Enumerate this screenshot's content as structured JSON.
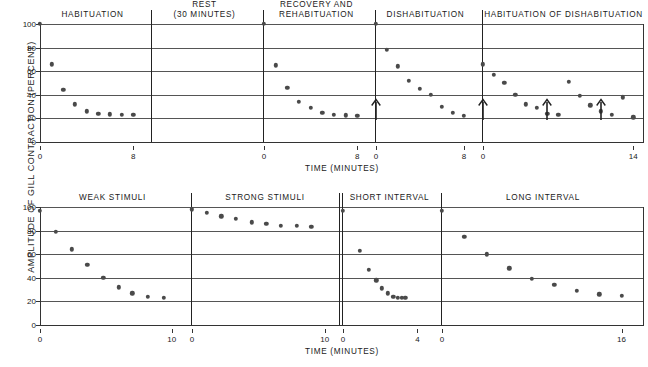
{
  "figure": {
    "y_axis_label": "AMPLITUDE OF GILL CONTRACTION (PERCENT)",
    "x_axis_label": "TIME (MINUTES)",
    "y_ticks": [
      0,
      20,
      40,
      60,
      80,
      100
    ],
    "dot_color": "#4a4a4a",
    "axis_color": "#333333",
    "grid_color": "#555555"
  },
  "chart_data": [
    {
      "type": "scatter",
      "id": "top-chart",
      "title": "",
      "xlabel": "TIME (MINUTES)",
      "ylabel": "AMPLITUDE OF GILL CONTRACTION (PERCENT)",
      "ylim": [
        0,
        100
      ],
      "yticks": [
        0,
        20,
        40,
        60,
        80,
        100
      ],
      "grid": true,
      "panels": [
        {
          "label": "HABITUATION",
          "xlim": [
            0,
            9
          ],
          "xticks": [
            0,
            8
          ],
          "x": [
            0,
            1,
            2,
            3,
            4,
            5,
            6,
            7,
            8
          ],
          "values": [
            100,
            66,
            44,
            32,
            26,
            24,
            23.5,
            23,
            23
          ],
          "arrows": []
        },
        {
          "label": "REST\n(30 MINUTES)",
          "label_line1": "REST",
          "label_line2": "(30 MINUTES)",
          "xlim": [
            0,
            9
          ],
          "xticks": [],
          "x": [],
          "values": [],
          "arrows": []
        },
        {
          "label": "RECOVERY AND\nREHABITUATION",
          "label_line1": "RECOVERY AND",
          "label_line2": "REHABITUATION",
          "xlim": [
            0,
            9
          ],
          "xticks": [
            0,
            8
          ],
          "x": [
            0,
            1,
            2,
            3,
            4,
            5,
            6,
            7,
            8
          ],
          "values": [
            100,
            65,
            46,
            34,
            29,
            25,
            23,
            22.5,
            22
          ],
          "arrows": []
        },
        {
          "label": "DISHABITUATION",
          "xlim": [
            0,
            9
          ],
          "xticks": [
            0,
            8
          ],
          "x": [
            0,
            1,
            2,
            3,
            4,
            5,
            6,
            7,
            8
          ],
          "values": [
            100,
            78,
            64,
            52,
            45,
            40,
            30,
            25,
            22
          ],
          "arrows": [
            0
          ]
        },
        {
          "label": "HABITUATION OF DISHABITUATION",
          "xlim": [
            0,
            15
          ],
          "xticks": [
            0,
            14
          ],
          "x": [
            0,
            1,
            2,
            3,
            4,
            5,
            6,
            7,
            8,
            9,
            10,
            11,
            12,
            13,
            14
          ],
          "values": [
            66,
            57,
            50,
            40,
            32,
            29,
            24,
            23,
            51,
            39,
            31,
            26,
            23,
            38,
            21
          ],
          "arrows": [
            0,
            6,
            11
          ]
        }
      ]
    },
    {
      "type": "scatter",
      "id": "bottom-chart",
      "title": "",
      "xlabel": "TIME (MINUTES)",
      "ylabel": "AMPLITUDE OF GILL CONTRACTION (PERCENT)",
      "ylim": [
        0,
        100
      ],
      "yticks": [
        0,
        20,
        40,
        60,
        80,
        100
      ],
      "grid": true,
      "panels": [
        {
          "label": "WEAK STIMULI",
          "xlim": [
            0,
            11
          ],
          "xticks": [
            0,
            10
          ],
          "x": [
            0,
            1.2,
            2.4,
            3.6,
            4.8,
            6,
            7,
            8.2,
            9.4
          ],
          "values": [
            97,
            79,
            64,
            51,
            40,
            32,
            27,
            24,
            23
          ],
          "arrows": []
        },
        {
          "label": "STRONG STIMULI",
          "xlim": [
            0,
            11
          ],
          "xticks": [
            0,
            10
          ],
          "x": [
            0,
            1.1,
            2.2,
            3.3,
            4.5,
            5.6,
            6.7,
            7.9,
            9
          ],
          "values": [
            98,
            95,
            92,
            90,
            87,
            86,
            84,
            84,
            83
          ],
          "arrows": []
        },
        {
          "label": "SHORT INTERVAL",
          "xlim": [
            0,
            5
          ],
          "xticks": [
            0,
            4
          ],
          "x": [
            0,
            0.9,
            1.4,
            1.8,
            2.1,
            2.4,
            2.7,
            2.95,
            3.15,
            3.35
          ],
          "values": [
            97,
            63,
            47,
            38,
            31,
            27,
            24,
            23,
            23,
            23
          ],
          "arrows": []
        },
        {
          "label": "LONG INTERVAL",
          "xlim": [
            0,
            18
          ],
          "xticks": [
            0,
            16
          ],
          "x": [
            0,
            2,
            4,
            6,
            8,
            10,
            12,
            14,
            16
          ],
          "values": [
            97,
            75,
            60,
            48,
            39,
            34,
            29,
            26,
            25
          ],
          "arrows": []
        }
      ]
    }
  ]
}
